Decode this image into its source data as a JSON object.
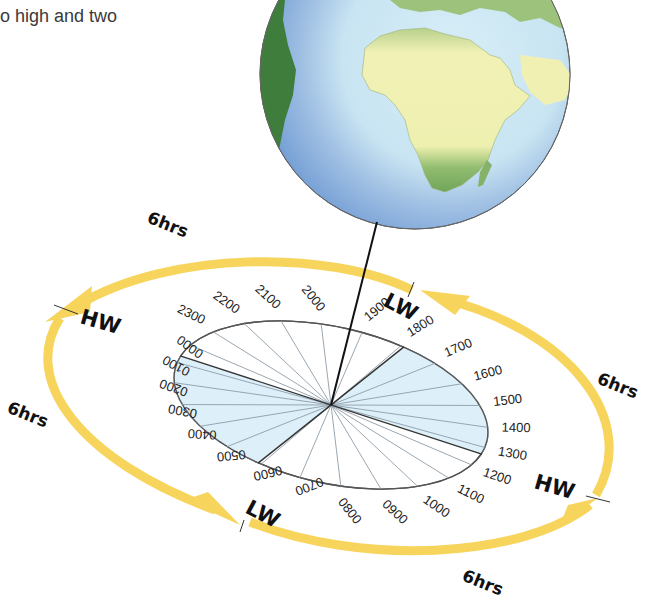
{
  "caption": "o high and two",
  "colors": {
    "orbit_arrow": "#f7d45c",
    "sector_fill": "#ddf0f9",
    "ocean": "#cde6f2",
    "ocean_shadow": "#7fa7d6",
    "land_light": "#f2f2b6",
    "land_green": "#8bb86a",
    "land_dark": "#3f7d3c",
    "line": "#111111"
  },
  "labels": {
    "hrs_top_left": "6hrs",
    "hrs_right": "6hrs",
    "hrs_left": "6hrs",
    "hrs_bottom": "6hrs",
    "hw_left": "HW",
    "hw_right": "HW",
    "lw_top": "LW",
    "lw_bottom": "LW"
  },
  "times": [
    "0000",
    "0100",
    "0200",
    "0300",
    "0400",
    "0500",
    "0600",
    "0700",
    "0800",
    "0900",
    "1000",
    "1100",
    "1200",
    "1300",
    "1400",
    "1500",
    "1600",
    "1700",
    "1800",
    "1900",
    "2000",
    "2100",
    "2200",
    "2300"
  ]
}
